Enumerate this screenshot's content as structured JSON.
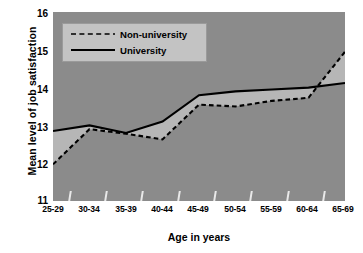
{
  "chart_data": {
    "type": "line",
    "title": "",
    "xlabel": "Age in years",
    "ylabel": "Mean level of job satisfaction",
    "categories": [
      "25-29",
      "30-34",
      "35-39",
      "40-44",
      "45-49",
      "50-54",
      "55-59",
      "60-64",
      "65-69"
    ],
    "ylim": [
      11,
      16
    ],
    "yticks": [
      11,
      12,
      13,
      14,
      15,
      16
    ],
    "grid": false,
    "legend_position": "top-left",
    "series": [
      {
        "name": "Non-university",
        "style": "dashed",
        "color": "#000000",
        "values": [
          11.97,
          12.9,
          12.78,
          12.63,
          13.55,
          13.5,
          13.65,
          13.73,
          14.95
        ]
      },
      {
        "name": "University",
        "style": "solid",
        "color": "#000000",
        "values": [
          12.85,
          13.0,
          12.8,
          13.1,
          13.8,
          13.9,
          13.95,
          14.0,
          14.12
        ]
      }
    ],
    "plot_background": "#8b8b8b",
    "band_fill": "#b6b6b6"
  },
  "axes": {
    "y_tick_labels": [
      "16",
      "15",
      "14",
      "13",
      "12",
      "11"
    ],
    "x_tick_labels": [
      "25-29",
      "30-34",
      "35-39",
      "40-44",
      "45-49",
      "50-54",
      "55-59",
      "60-64",
      "65-69"
    ],
    "y_axis_title": "Mean level of job satisfaction",
    "x_axis_title": "Age in years"
  },
  "legend": {
    "items": [
      {
        "label": "Non-university",
        "style": "dashed"
      },
      {
        "label": "University",
        "style": "solid"
      }
    ]
  }
}
